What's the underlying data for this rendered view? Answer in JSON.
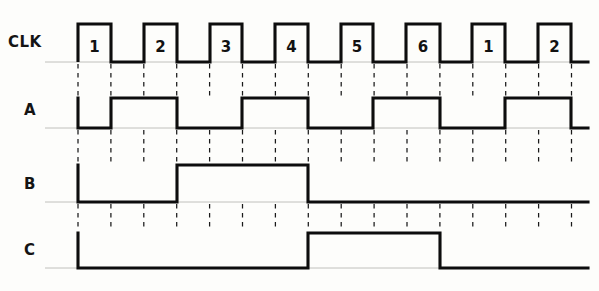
{
  "diagram": {
    "type": "timing-waveform",
    "width": 599,
    "height": 291,
    "background_color": "#fdfdfb",
    "wave_color": "#0d0d0d",
    "grid_color": "#1a1a1a",
    "rail_color": "#b9b9b4"
  },
  "axis": {
    "left_margin_px": 45,
    "wave_start_x": 78,
    "wave_end_x": 588,
    "grid_start_x": 78,
    "grid_end_x": 571,
    "grid_step_px": 32.9,
    "grid_count": 16,
    "clock_period_px": 65.8,
    "clock_duty_percent": 50
  },
  "clock": {
    "label": "CLK",
    "label_x": 8,
    "label_y": 47,
    "baseline_y": 62,
    "high_y": 24,
    "pulse_numbers": [
      "1",
      "2",
      "3",
      "4",
      "5",
      "6",
      "1",
      "2"
    ],
    "pulse_edges": [
      {
        "rise": 78,
        "fall": 111
      },
      {
        "rise": 144,
        "fall": 177
      },
      {
        "rise": 210,
        "fall": 242
      },
      {
        "rise": 275,
        "fall": 308
      },
      {
        "rise": 341,
        "fall": 373
      },
      {
        "rise": 406,
        "fall": 440
      },
      {
        "rise": 472,
        "fall": 505
      },
      {
        "rise": 538,
        "fall": 571
      }
    ]
  },
  "signals": [
    {
      "name": "A",
      "label": "A",
      "label_x": 24,
      "label_y": 115,
      "baseline_y": 128,
      "high_y": 98,
      "start_x": 78,
      "end_x": 588,
      "divider": "divide-by-2",
      "high_intervals": [
        {
          "start": 111,
          "end": 177
        },
        {
          "start": 242,
          "end": 308
        },
        {
          "start": 373,
          "end": 440
        },
        {
          "start": 505,
          "end": 571
        }
      ]
    },
    {
      "name": "B",
      "label": "B",
      "label_x": 24,
      "label_y": 189,
      "baseline_y": 202,
      "high_y": 165,
      "start_x": 78,
      "end_x": 588,
      "divider": "divide-by-4",
      "high_intervals": [
        {
          "start": 177,
          "end": 308
        }
      ]
    },
    {
      "name": "C",
      "label": "C",
      "label_x": 24,
      "label_y": 255,
      "baseline_y": 268,
      "high_y": 233,
      "start_x": 78,
      "end_x": 588,
      "divider": "divide-by-8",
      "high_intervals": [
        {
          "start": 308,
          "end": 440
        }
      ]
    }
  ],
  "grid_rows": [
    {
      "name": "clk-to-a",
      "y_top": 64,
      "y_bottom": 96
    },
    {
      "name": "a-to-b",
      "y_top": 130,
      "y_bottom": 163
    },
    {
      "name": "b-to-c",
      "y_top": 204,
      "y_bottom": 231
    }
  ],
  "rails": [
    {
      "name": "clk-rail",
      "y": 62
    },
    {
      "name": "a-rail",
      "y": 128
    },
    {
      "name": "b-rail",
      "y": 202
    },
    {
      "name": "c-rail",
      "y": 268
    }
  ]
}
